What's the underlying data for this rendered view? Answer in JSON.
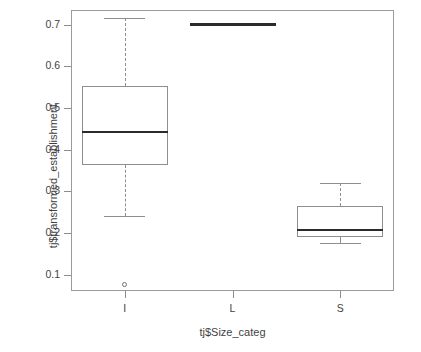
{
  "chart_data": {
    "type": "box",
    "title": "",
    "xlabel": "tj$Size_categ",
    "ylabel": "tj$transformed_establishment",
    "categories": [
      "I",
      "L",
      "S"
    ],
    "ylim": [
      0.06,
      0.735
    ],
    "ytick_labels": [
      "0.7",
      "0.6",
      "0.5",
      "0.4",
      "0.3",
      "0.2",
      "0.1"
    ],
    "ytick_values": [
      0.7,
      0.6,
      0.5,
      0.4,
      0.3,
      0.2,
      0.1
    ],
    "grid": false,
    "legend": "none",
    "boxes": [
      {
        "category": "I",
        "whisker_low": 0.24,
        "q1": 0.362,
        "median": 0.443,
        "q3": 0.553,
        "whisker_high": 0.715,
        "outliers": [
          0.075
        ]
      },
      {
        "category": "L",
        "whisker_low": 0.699,
        "q1": 0.699,
        "median": 0.699,
        "q3": 0.699,
        "whisker_high": 0.699,
        "outliers": []
      },
      {
        "category": "S",
        "whisker_low": 0.175,
        "q1": 0.19,
        "median": 0.207,
        "q3": 0.265,
        "whisker_high": 0.32,
        "outliers": []
      }
    ]
  },
  "colors": {
    "background": "#ffffff",
    "frame": "#9a9a9a",
    "box_outline": "#8e8e8e",
    "median": "#2b2b2b",
    "text": "#3f3f3f"
  },
  "geometry": {
    "plot_left": 71,
    "plot_right": 394,
    "plot_top": 10,
    "plot_bottom": 291,
    "y_value_top": 0.735,
    "y_value_bottom": 0.0605,
    "box_half_width": 43
  }
}
